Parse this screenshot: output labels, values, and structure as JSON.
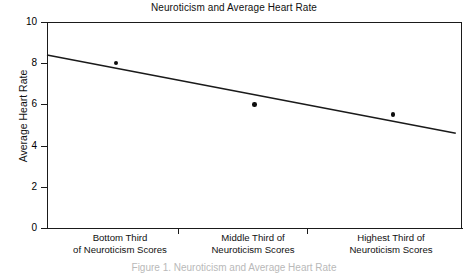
{
  "chart_data": {
    "type": "scatter",
    "title": "Neuroticism and Average Heart Rate",
    "xlabel": "",
    "ylabel": "Average Heart Rate",
    "ylim": [
      0,
      10
    ],
    "yticks": [
      "0",
      "2",
      "4",
      "6",
      "8",
      "10"
    ],
    "grid": false,
    "legend": null,
    "categories": [
      "Bottom Third of Neuroticism Scores",
      "Middle Third of Neuroticism Scores",
      "Highest Third of Neuroticism Scores"
    ],
    "category_lines": [
      [
        "Bottom Third",
        "of Neuroticism Scores"
      ],
      [
        "Middle Third of",
        "Neuroticism Scores"
      ],
      [
        "Highest Third of",
        "Neuroticism Scores"
      ]
    ],
    "values": [
      8.0,
      6.0,
      5.5
    ],
    "series": [
      {
        "name": "Average Heart Rate",
        "values": [
          8.0,
          6.0,
          5.5
        ]
      }
    ],
    "trendline": {
      "type": "line",
      "x_start": 0.0,
      "y_start": 8.4,
      "x_end": 0.985,
      "y_end": 4.6
    },
    "marker_color": "#0d0d0d",
    "line_color": "#1a1a1a",
    "axis_color": "#1a1a1a",
    "background": "#ffffff"
  },
  "caption": {
    "text": "Figure 1. Neuroticism and Average Heart Rate"
  }
}
